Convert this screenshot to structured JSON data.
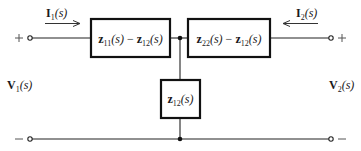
{
  "diagram": {
    "type": "two-port T-equivalent circuit (z-parameters)",
    "port1": {
      "plus_sign": "+",
      "minus_sign": "−",
      "voltage": {
        "symbol": "V",
        "sub": "1",
        "arg": "(s)"
      },
      "current": {
        "symbol": "I",
        "sub": "1",
        "arg": "(s)",
        "direction": "right"
      }
    },
    "port2": {
      "plus_sign": "+",
      "minus_sign": "−",
      "voltage": {
        "symbol": "V",
        "sub": "2",
        "arg": "(s)"
      },
      "current": {
        "symbol": "I",
        "sub": "2",
        "arg": "(s)",
        "direction": "left"
      }
    },
    "impedances": {
      "series_left": {
        "a": "z",
        "a_sub": "11",
        "a_arg": "(s)",
        "op": " − ",
        "b": "z",
        "b_sub": "12",
        "b_arg": "(s)"
      },
      "series_right": {
        "a": "z",
        "a_sub": "22",
        "a_arg": "(s)",
        "op": " − ",
        "b": "z",
        "b_sub": "12",
        "b_arg": "(s)"
      },
      "shunt": {
        "a": "z",
        "a_sub": "12",
        "a_arg": "(s)"
      }
    },
    "nodes": [
      "top-junction",
      "bottom-junction"
    ],
    "colors": {
      "line": "#222222",
      "background": "#ffffff"
    }
  }
}
